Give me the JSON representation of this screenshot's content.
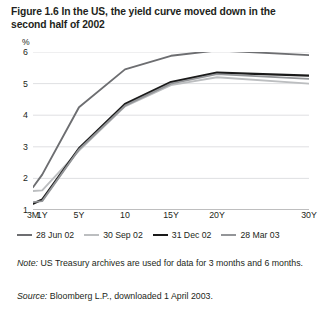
{
  "figure": {
    "title": "Figure 1.6  In the US, the yield curve moved down in the second half of 2002",
    "note_label": "Note:",
    "note_text": " US Treasury archives are used for data for 3 months and 6 months.",
    "source_label": "Source:",
    "source_text": " Bloomberg L.P., downloaded 1 April 2003."
  },
  "chart_data": {
    "type": "line",
    "title": "Figure 1.6  In the US, the yield curve moved down in the second half of 2002",
    "xlabel": "",
    "ylabel": "%",
    "ylim": [
      1,
      6
    ],
    "yticks": [
      1,
      2,
      3,
      4,
      5,
      6
    ],
    "grid": true,
    "legend_position": "below",
    "categories": [
      "3M",
      "1Y",
      "5Y",
      "10",
      "15Y",
      "20Y",
      "30Y"
    ],
    "x": [
      0,
      1,
      5,
      10,
      15,
      20,
      30
    ],
    "series": [
      {
        "name": "28 Jun 02",
        "color": "#6d6e71",
        "width": 1.9,
        "values": [
          1.72,
          2.12,
          4.25,
          5.45,
          5.88,
          6.05,
          5.9
        ]
      },
      {
        "name": "30 Sep 02",
        "color": "#bcbec0",
        "width": 1.9,
        "values": [
          1.6,
          1.62,
          2.88,
          4.28,
          4.95,
          5.2,
          5.0
        ]
      },
      {
        "name": "31 Dec 02",
        "color": "#1a1a1a",
        "width": 2.3,
        "values": [
          1.2,
          1.33,
          2.95,
          4.35,
          5.05,
          5.35,
          5.25
        ]
      },
      {
        "name": "28 Mar 03",
        "color": "#939598",
        "width": 1.9,
        "values": [
          1.25,
          1.28,
          2.92,
          4.3,
          5.0,
          5.3,
          5.15
        ]
      }
    ]
  }
}
